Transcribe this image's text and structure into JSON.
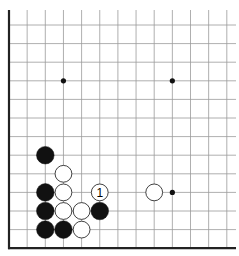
{
  "diagram": {
    "type": "go-board-fragment",
    "visible_edges": [
      "left",
      "bottom"
    ],
    "columns_visible": 13,
    "rows_visible": 13,
    "colors": {
      "background": "#ffffff",
      "grid": "#9a9a9a",
      "edge": "#222222",
      "black_stone": "#111111",
      "white_stone": "#ffffff"
    },
    "star_points": [
      {
        "col": 3,
        "row": 3
      },
      {
        "col": 9,
        "row": 3
      },
      {
        "col": 9,
        "row": 9
      }
    ],
    "stones": [
      {
        "color": "black",
        "col": 2,
        "row": 7,
        "label": ""
      },
      {
        "color": "white",
        "col": 3,
        "row": 8,
        "label": ""
      },
      {
        "color": "black",
        "col": 2,
        "row": 9,
        "label": ""
      },
      {
        "color": "white",
        "col": 3,
        "row": 9,
        "label": ""
      },
      {
        "color": "white",
        "col": 5,
        "row": 9,
        "label": "1"
      },
      {
        "color": "white",
        "col": 8,
        "row": 9,
        "label": ""
      },
      {
        "color": "black",
        "col": 2,
        "row": 10,
        "label": ""
      },
      {
        "color": "white",
        "col": 3,
        "row": 10,
        "label": ""
      },
      {
        "color": "white",
        "col": 4,
        "row": 10,
        "label": ""
      },
      {
        "color": "black",
        "col": 5,
        "row": 10,
        "label": ""
      },
      {
        "color": "black",
        "col": 2,
        "row": 11,
        "label": ""
      },
      {
        "color": "black",
        "col": 3,
        "row": 11,
        "label": ""
      },
      {
        "color": "white",
        "col": 4,
        "row": 11,
        "label": ""
      }
    ],
    "move_labels": {
      "move_1": "1"
    }
  }
}
